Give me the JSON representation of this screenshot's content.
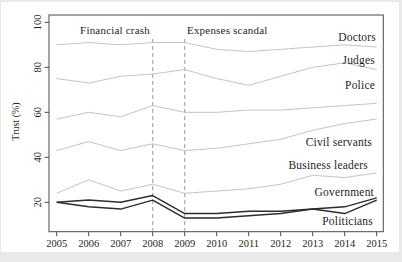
{
  "chart_data": {
    "type": "line",
    "title": "",
    "xlabel": "",
    "ylabel": "Trust (%)",
    "x": [
      2005,
      2006,
      2007,
      2008,
      2009,
      2010,
      2011,
      2012,
      2013,
      2014,
      2015
    ],
    "y_ticks": [
      20,
      40,
      60,
      80,
      100
    ],
    "ylim": [
      7,
      103
    ],
    "xlim": [
      2004.8,
      2015.2
    ],
    "grid": false,
    "legend_position": "right-inline-labels",
    "annotations": [
      {
        "text": "Financial crash",
        "x": 2008
      },
      {
        "text": "Expenses scandal",
        "x": 2009
      }
    ],
    "series": [
      {
        "name": "Doctors",
        "color": "#c4c4c4",
        "emphasis": false,
        "values": [
          90,
          91,
          90,
          91,
          91,
          88,
          87,
          88,
          89,
          90,
          89
        ]
      },
      {
        "name": "Judges",
        "color": "#c4c4c4",
        "emphasis": false,
        "values": [
          75,
          73,
          76,
          77,
          79,
          75,
          72,
          76,
          80,
          82,
          79
        ]
      },
      {
        "name": "Police",
        "color": "#c4c4c4",
        "emphasis": false,
        "values": [
          57,
          60,
          58,
          63,
          60,
          60,
          61,
          61,
          62,
          63,
          64
        ]
      },
      {
        "name": "Civil servants",
        "color": "#c4c4c4",
        "emphasis": false,
        "values": [
          43,
          47,
          43,
          46,
          43,
          44,
          46,
          48,
          52,
          55,
          57
        ]
      },
      {
        "name": "Business leaders",
        "color": "#c4c4c4",
        "emphasis": false,
        "values": [
          24,
          30,
          25,
          28,
          24,
          25,
          26,
          28,
          32,
          31,
          33
        ]
      },
      {
        "name": "Government",
        "color": "#2d2d2d",
        "emphasis": true,
        "values": [
          20,
          21,
          20,
          23,
          15,
          15,
          16,
          16,
          17,
          18,
          22
        ]
      },
      {
        "name": "Politicians",
        "color": "#2d2d2d",
        "emphasis": true,
        "values": [
          20,
          18,
          17,
          21,
          13,
          13,
          14,
          15,
          17,
          15,
          21
        ]
      }
    ]
  }
}
